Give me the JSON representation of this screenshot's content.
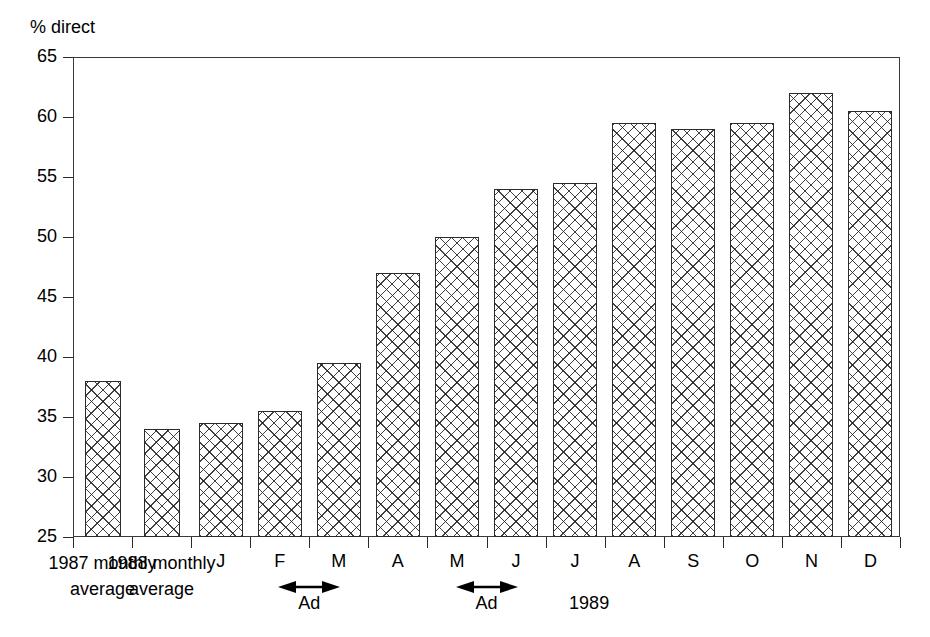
{
  "chart_data": {
    "type": "bar",
    "title": "",
    "ylabel": "% direct",
    "xlabel": "",
    "ylim": [
      25,
      65
    ],
    "ytick_values": [
      65,
      60,
      55,
      50,
      45,
      40,
      35,
      30,
      25
    ],
    "ytick_labels": [
      "65",
      "60",
      "55",
      "50",
      "45",
      "40",
      "35",
      "30",
      "25"
    ],
    "grid": false,
    "legend": "none",
    "categories": [
      "1987 monthly average",
      "1988 monthly average",
      "J",
      "F",
      "M",
      "A",
      "M",
      "J",
      "J",
      "A",
      "S",
      "O",
      "N",
      "D"
    ],
    "values": [
      38,
      34,
      34.5,
      35.5,
      39.5,
      47,
      50,
      54,
      54.5,
      59.5,
      59,
      59.5,
      62,
      60.5
    ],
    "annotations": [
      {
        "text": "Ad",
        "spans": [
          "F",
          "M"
        ]
      },
      {
        "text": "Ad",
        "spans": [
          "M",
          "J"
        ]
      },
      {
        "text": "1989",
        "note": "period label for monthly bars"
      }
    ]
  },
  "axis": {
    "y_title": "% direct",
    "y_ticks": [
      "65",
      "60",
      "55",
      "50",
      "45",
      "40",
      "35",
      "30",
      "25"
    ]
  },
  "x_labels": [
    {
      "line1": "1987 monthly",
      "line2": "average"
    },
    {
      "line1": "1988 monthly",
      "line2": "average"
    },
    {
      "line1": "J"
    },
    {
      "line1": "F"
    },
    {
      "line1": "M"
    },
    {
      "line1": "A"
    },
    {
      "line1": "M"
    },
    {
      "line1": "J"
    },
    {
      "line1": "J"
    },
    {
      "line1": "A"
    },
    {
      "line1": "S"
    },
    {
      "line1": "O"
    },
    {
      "line1": "N"
    },
    {
      "line1": "D"
    }
  ],
  "annotations": {
    "ad_1": "Ad",
    "ad_2": "Ad",
    "year": "1989"
  },
  "colors": {
    "axis": "#2a2a2a",
    "bar_outline": "#2b2b2b",
    "bar_fill": "#ffffff",
    "background": "#ffffff"
  }
}
